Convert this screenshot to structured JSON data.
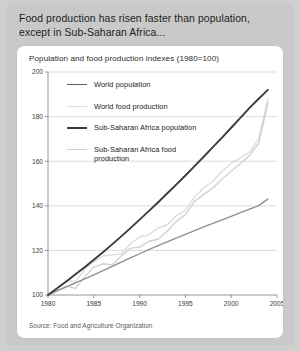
{
  "card": {
    "title": "Food production has risen faster than population, except in Sub-Saharan Africa...",
    "subtitle": "Population and food production indexes (1980=100)",
    "source": "Source: Food and Agriculture Organization"
  },
  "colors": {
    "background": "#cfcfcf",
    "card": "#c9c9c9",
    "panel": "#ffffff",
    "grid": "#d2d2d2",
    "axis": "#8a8a8a",
    "world_population": "#8e8e8e",
    "world_food_production": "#dcdcdc",
    "ssa_population": "#3b3b3b",
    "ssa_food_production": "#d0d0d0"
  },
  "legend": [
    {
      "label": "World population",
      "color": "#5f5f5f",
      "width": 1.9
    },
    {
      "label": "World food production",
      "color": "#dedede",
      "width": 1.9
    },
    {
      "label": "Sub-Saharan Africa population",
      "color": "#3b3b3b",
      "width": 2.3
    },
    {
      "label": "Sub-Saharan Africa food production",
      "color": "#d0d0d0",
      "width": 1.9
    }
  ],
  "chart_data": {
    "type": "line",
    "title": "Population and food production indexes (1980=100)",
    "xlabel": "",
    "ylabel": "",
    "xlim": [
      1980,
      2005
    ],
    "ylim": [
      100,
      200
    ],
    "xticks": [
      1980,
      1985,
      1990,
      1995,
      2000,
      2005
    ],
    "yticks": [
      100,
      120,
      140,
      160,
      180,
      200
    ],
    "grid": true,
    "legend_position": "inside-upper-left",
    "x": [
      1980,
      1981,
      1982,
      1983,
      1984,
      1985,
      1986,
      1987,
      1988,
      1989,
      1990,
      1991,
      1992,
      1993,
      1994,
      1995,
      1996,
      1997,
      1998,
      1999,
      2000,
      2001,
      2002,
      2003,
      2004
    ],
    "series": [
      {
        "name": "World population",
        "color": "#8e8e8e",
        "values": [
          100,
          101.8,
          103.6,
          105.4,
          107.2,
          109.0,
          110.9,
          112.8,
          114.7,
          116.6,
          118.5,
          120.3,
          122.1,
          123.8,
          125.5,
          127.2,
          128.9,
          130.5,
          132.1,
          133.7,
          135.3,
          136.9,
          138.5,
          140.1,
          143.0
        ]
      },
      {
        "name": "World food production",
        "color": "#dcdcdc",
        "values": [
          100,
          103.0,
          106.5,
          106.0,
          111.5,
          115.0,
          117.5,
          118.0,
          118.5,
          123.0,
          126.0,
          127.0,
          130.0,
          131.5,
          135.5,
          138.0,
          144.0,
          148.0,
          151.0,
          155.5,
          159.0,
          161.5,
          164.0,
          170.0,
          188.0
        ]
      },
      {
        "name": "Sub-Saharan Africa population",
        "color": "#3b3b3b",
        "values": [
          100,
          103.0,
          106.1,
          109.3,
          112.5,
          115.8,
          119.2,
          122.7,
          126.3,
          130.0,
          133.8,
          137.6,
          141.5,
          145.5,
          149.5,
          153.6,
          157.8,
          162.0,
          166.3,
          170.6,
          175.0,
          179.4,
          183.9,
          188.0,
          192.0
        ]
      },
      {
        "name": "Sub-Saharan Africa food production",
        "color": "#d0d0d0",
        "values": [
          100,
          102.0,
          104.0,
          103.0,
          108.0,
          112.5,
          114.0,
          113.5,
          117.5,
          121.0,
          121.5,
          124.0,
          125.0,
          128.5,
          133.0,
          136.0,
          142.0,
          145.0,
          148.0,
          152.0,
          155.5,
          159.0,
          162.5,
          168.0,
          186.0
        ]
      }
    ]
  },
  "axis": {
    "yticklabels": [
      "200",
      "180",
      "160",
      "140",
      "120",
      "100"
    ],
    "xticklabels": [
      "1980",
      "1985",
      "1990",
      "1995",
      "2000",
      "2005"
    ]
  }
}
